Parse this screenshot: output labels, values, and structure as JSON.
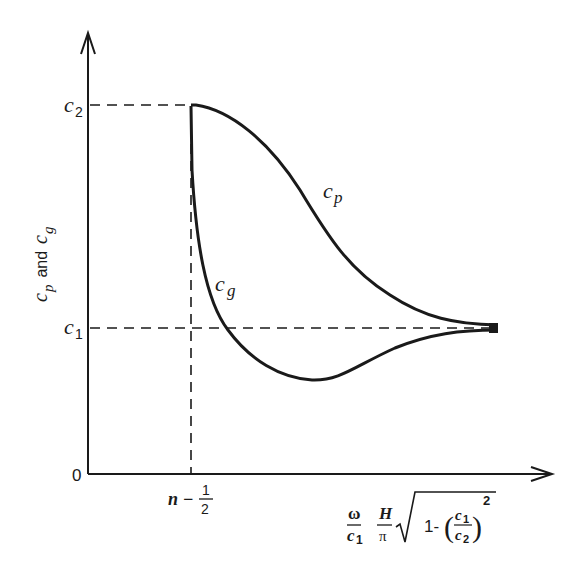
{
  "figure": {
    "type": "dispersion-curve-diagram",
    "y_axis": {
      "label_main": "c",
      "label_p_sub": "p",
      "label_and": " and ",
      "label_g_sub": "g",
      "ticks": [
        {
          "base": "c",
          "sub": "2"
        },
        {
          "base": "c",
          "sub": "1"
        },
        {
          "text": "0"
        }
      ]
    },
    "x_axis": {
      "tick": {
        "left": "n −",
        "num": "1",
        "den": "2"
      },
      "label": {
        "omega": "ω",
        "c1_base": "c",
        "c1_sub": "1",
        "H": "H",
        "pi": "π",
        "one_minus": "1-",
        "frac_num_base": "c",
        "frac_num_sub": "1",
        "frac_den_base": "c",
        "frac_den_sub": "2",
        "exponent": "2"
      }
    },
    "curves": [
      {
        "name": "phase-velocity",
        "label_base": "c",
        "label_sub": "p"
      },
      {
        "name": "group-velocity",
        "label_base": "c",
        "label_sub": "g"
      }
    ],
    "colors": {
      "ink": "#1a1a1a",
      "background": "#ffffff"
    }
  }
}
